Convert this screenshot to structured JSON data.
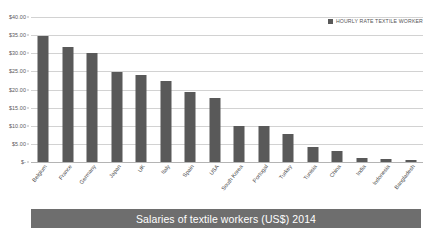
{
  "chart_data": {
    "type": "bar",
    "title": "Salaries of textile workers (US$) 2014",
    "xlabel": "",
    "ylabel": "",
    "ylim": [
      0,
      40
    ],
    "ytick_step": 5,
    "grid": true,
    "legend_position": "top-right",
    "series_name": "HOURLY RATE TEXTILE WORKER",
    "bar_color": "#595959",
    "categories": [
      "Belgium",
      "France",
      "Germany",
      "Japan",
      "UK",
      "Italy",
      "Spain",
      "USA",
      "South Korea",
      "Portugal",
      "Turkey",
      "Tunisia",
      "China",
      "India",
      "Indonesia",
      "Bangladesh"
    ],
    "values": [
      34.9,
      31.7,
      30.0,
      24.9,
      24.0,
      22.4,
      19.4,
      17.6,
      10.0,
      9.8,
      7.7,
      4.1,
      3.0,
      1.1,
      0.8,
      0.6
    ],
    "ytick_labels": [
      "$40.00",
      "$35.00",
      "$30.00",
      "$25.00",
      "$20.00",
      "$15.00",
      "$10.00",
      "$5.00",
      "$-"
    ],
    "ytick_values": [
      40,
      35,
      30,
      25,
      20,
      15,
      10,
      5,
      0
    ]
  },
  "legend": {
    "label": "HOURLY RATE TEXTILE WORKER",
    "swatch_color": "#595959"
  },
  "banner": {
    "title": "Salaries of textile workers (US$) 2014",
    "background": "#6e6e6e",
    "text_color": "#ffffff"
  }
}
